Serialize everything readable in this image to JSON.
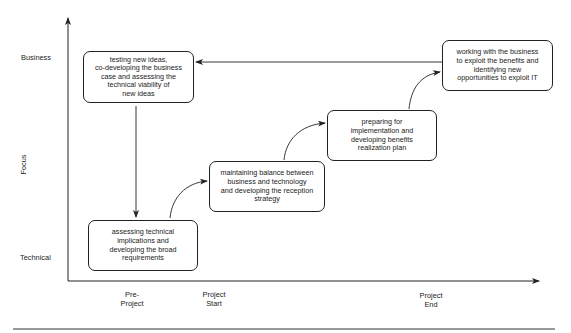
{
  "axes": {
    "y_label": "Focus",
    "y_ticks": [
      "Business",
      "Technical"
    ],
    "x_ticks": [
      "Pre-\nProject",
      "Project\nStart",
      "Project\nEnd"
    ]
  },
  "boxes": [
    {
      "id": "testing",
      "text": "testing new ideas,\nco-developing the business\ncase and assessing the\ntechnical viability of\nnew ideas"
    },
    {
      "id": "assessing",
      "text": "assessing technical\nimplications and\ndeveloping  the broad\nrequirements"
    },
    {
      "id": "maintaining",
      "text": "maintaining balance between\nbusiness and technology\nand developing the reception\nstrategy"
    },
    {
      "id": "preparing",
      "text": "preparing for\nimplementation and\ndeveloping benefits\nrealization plan"
    },
    {
      "id": "working",
      "text": "working with the business\nto exploit the benefits and\nidentifying new\nopportunities to exploit IT"
    }
  ],
  "colors": {
    "line": "#222222",
    "background": "#ffffff"
  }
}
